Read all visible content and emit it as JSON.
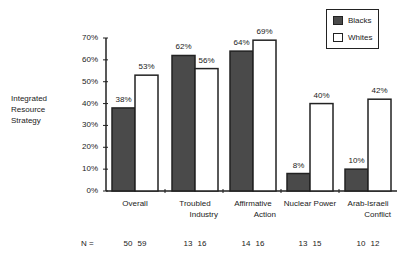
{
  "chart_data": {
    "type": "bar",
    "title": "",
    "ylabel": "Integrated Resource Strategy",
    "xlabel": "",
    "ylim": [
      0,
      70
    ],
    "yticks": [
      "0%",
      "10%",
      "20%",
      "30%",
      "40%",
      "50%",
      "60%",
      "70%"
    ],
    "grid": false,
    "legend_position": "top-right",
    "categories": [
      "Overall",
      "Troubled Industry",
      "Affirmative Action",
      "Nuclear Power",
      "Arab-Israeli Conflict"
    ],
    "category_lines": [
      [
        "Overall"
      ],
      [
        "Troubled",
        "Industry"
      ],
      [
        "Affirmative",
        "Action"
      ],
      [
        "Nuclear Power"
      ],
      [
        "Arab-Israeli",
        "Conflict"
      ]
    ],
    "series": [
      {
        "name": "Blacks",
        "color": "#4a4a4a",
        "values": [
          38,
          62,
          64,
          8,
          10
        ],
        "labels": [
          "38%",
          "62%",
          "64%",
          "8%",
          "10%"
        ]
      },
      {
        "name": "Whites",
        "color": "#ffffff",
        "values": [
          53,
          56,
          69,
          40,
          42
        ],
        "labels": [
          "53%",
          "56%",
          "69%",
          "40%",
          "42%"
        ]
      }
    ],
    "n_label": "N =",
    "n_values": [
      [
        "50",
        "59"
      ],
      [
        "13",
        "16"
      ],
      [
        "14",
        "16"
      ],
      [
        "13",
        "15"
      ],
      [
        "10",
        "12"
      ]
    ]
  },
  "ylabel_lines": [
    "Integrated",
    "Resource",
    "Strategy"
  ],
  "legend": {
    "blacks": "Blacks",
    "whites": "Whites"
  }
}
